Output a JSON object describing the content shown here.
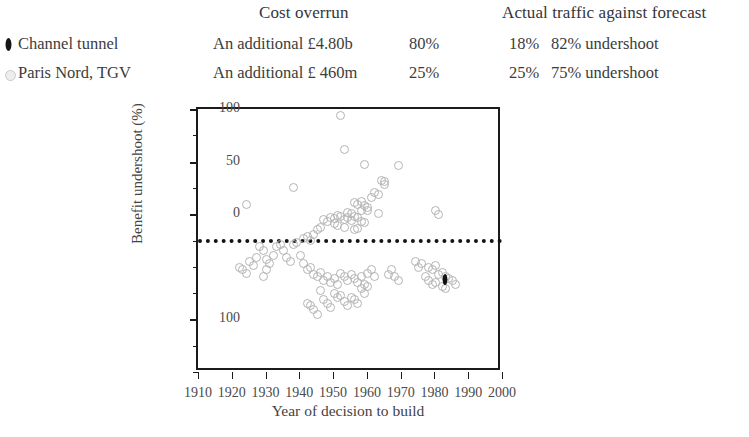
{
  "table": {
    "headers": {
      "cost_overrun": "Cost overrun",
      "actual_traffic": "Actual traffic against forecast"
    },
    "rows": [
      {
        "marker": "filled-diamond-marker",
        "name": "Channel tunnel",
        "cost_overrun_text": "An additional £4.80b",
        "cost_overrun_pct": "80%",
        "traffic_pct": "18%",
        "traffic_text": "82% undershoot"
      },
      {
        "marker": "open-circle-marker",
        "name": "Paris Nord, TGV",
        "cost_overrun_text": "An additional £ 460m",
        "cost_overrun_pct": "25%",
        "traffic_pct": "25%",
        "traffic_text": "75% undershoot"
      }
    ]
  },
  "chart_data": {
    "type": "scatter",
    "title": "",
    "xlabel": "Year of decision to build",
    "ylabel": "Benefit undershoot (%)",
    "xlim": [
      1910,
      2000
    ],
    "ylim": [
      -150,
      100
    ],
    "xticks": [
      1910,
      1920,
      1930,
      1940,
      1950,
      1960,
      1970,
      1980,
      1990,
      2000
    ],
    "xtick_labels": [
      "1910",
      "1920",
      "1930",
      "1940",
      "1950",
      "1960",
      "1970",
      "1980",
      "1990",
      "2000"
    ],
    "yticks": [
      100,
      75,
      50,
      25,
      0,
      -25,
      -50,
      -75,
      -100,
      -125,
      -150
    ],
    "ytick_labels": [
      "100",
      "",
      "50",
      "",
      "0",
      "",
      "",
      "",
      "100",
      "",
      ""
    ],
    "grid": false,
    "legend_position": "top-left-external",
    "reference_line": {
      "y": 0,
      "style": "dotted",
      "color": "#141414"
    },
    "series": [
      {
        "name": "Paris Nord, TGV",
        "marker": "open-circle",
        "color": "#b4b4b4",
        "points": [
          [
            1952,
            95
          ],
          [
            1953,
            62
          ],
          [
            1959,
            48
          ],
          [
            1969,
            47
          ],
          [
            1938,
            26
          ],
          [
            1964,
            33
          ],
          [
            1965,
            32
          ],
          [
            1965,
            29
          ],
          [
            1962,
            22
          ],
          [
            1963,
            20
          ],
          [
            1961,
            17
          ],
          [
            1958,
            13
          ],
          [
            1956,
            12
          ],
          [
            1957,
            10
          ],
          [
            1959,
            9
          ],
          [
            1960,
            7
          ],
          [
            1924,
            10
          ],
          [
            1958,
            4
          ],
          [
            1960,
            4
          ],
          [
            1963,
            2
          ],
          [
            1954,
            3
          ],
          [
            1955,
            2
          ],
          [
            1951,
            0
          ],
          [
            1952,
            -1
          ],
          [
            1956,
            -1
          ],
          [
            1957,
            -2
          ],
          [
            1980,
            4
          ],
          [
            1981,
            1
          ],
          [
            1949,
            -2
          ],
          [
            1950,
            -3
          ],
          [
            1953,
            -4
          ],
          [
            1954,
            -2
          ],
          [
            1955,
            -5
          ],
          [
            1958,
            -6
          ],
          [
            1959,
            -7
          ],
          [
            1947,
            -4
          ],
          [
            1948,
            -6
          ],
          [
            1950,
            -8
          ],
          [
            1951,
            -10
          ],
          [
            1953,
            -12
          ],
          [
            1956,
            -14
          ],
          [
            1957,
            -13
          ],
          [
            1945,
            -14
          ],
          [
            1946,
            -12
          ],
          [
            1944,
            -18
          ],
          [
            1941,
            -22
          ],
          [
            1942,
            -20
          ],
          [
            1943,
            -24
          ],
          [
            1938,
            -28
          ],
          [
            1939,
            -26
          ],
          [
            1933,
            -30
          ],
          [
            1934,
            -28
          ],
          [
            1928,
            -30
          ],
          [
            1929,
            -34
          ],
          [
            1927,
            -40
          ],
          [
            1930,
            -42
          ],
          [
            1931,
            -46
          ],
          [
            1926,
            -48
          ],
          [
            1925,
            -44
          ],
          [
            1922,
            -50
          ],
          [
            1923,
            -52
          ],
          [
            1924,
            -55
          ],
          [
            1936,
            -40
          ],
          [
            1937,
            -44
          ],
          [
            1940,
            -38
          ],
          [
            1941,
            -46
          ],
          [
            1942,
            -52
          ],
          [
            1943,
            -50
          ],
          [
            1944,
            -56
          ],
          [
            1945,
            -58
          ],
          [
            1946,
            -54
          ],
          [
            1947,
            -62
          ],
          [
            1948,
            -58
          ],
          [
            1949,
            -64
          ],
          [
            1950,
            -60
          ],
          [
            1951,
            -66
          ],
          [
            1952,
            -55
          ],
          [
            1953,
            -58
          ],
          [
            1954,
            -62
          ],
          [
            1955,
            -56
          ],
          [
            1956,
            -60
          ],
          [
            1957,
            -64
          ],
          [
            1958,
            -58
          ],
          [
            1959,
            -66
          ],
          [
            1960,
            -55
          ],
          [
            1961,
            -52
          ],
          [
            1962,
            -58
          ],
          [
            1950,
            -74
          ],
          [
            1951,
            -78
          ],
          [
            1952,
            -76
          ],
          [
            1946,
            -72
          ],
          [
            1947,
            -80
          ],
          [
            1948,
            -84
          ],
          [
            1949,
            -88
          ],
          [
            1953,
            -82
          ],
          [
            1954,
            -86
          ],
          [
            1955,
            -78
          ],
          [
            1956,
            -80
          ],
          [
            1957,
            -84
          ],
          [
            1944,
            -90
          ],
          [
            1945,
            -94
          ],
          [
            1943,
            -86
          ],
          [
            1942,
            -84
          ],
          [
            1958,
            -70
          ],
          [
            1959,
            -74
          ],
          [
            1960,
            -68
          ],
          [
            1978,
            -50
          ],
          [
            1979,
            -52
          ],
          [
            1980,
            -48
          ],
          [
            1981,
            -56
          ],
          [
            1982,
            -54
          ],
          [
            1983,
            -58
          ],
          [
            1978,
            -62
          ],
          [
            1979,
            -66
          ],
          [
            1980,
            -64
          ],
          [
            1982,
            -68
          ],
          [
            1984,
            -60
          ],
          [
            1985,
            -62
          ],
          [
            1986,
            -66
          ],
          [
            1983,
            -70
          ],
          [
            1977,
            -58
          ],
          [
            1976,
            -46
          ],
          [
            1975,
            -50
          ],
          [
            1974,
            -44
          ],
          [
            1966,
            -56
          ],
          [
            1967,
            -52
          ],
          [
            1968,
            -58
          ],
          [
            1969,
            -62
          ],
          [
            1935,
            -34
          ],
          [
            1932,
            -38
          ],
          [
            1930,
            -52
          ],
          [
            1929,
            -58
          ]
        ]
      },
      {
        "name": "Channel tunnel",
        "marker": "filled-diamond",
        "color": "#101010",
        "points": [
          [
            1983,
            -62
          ]
        ]
      }
    ]
  }
}
